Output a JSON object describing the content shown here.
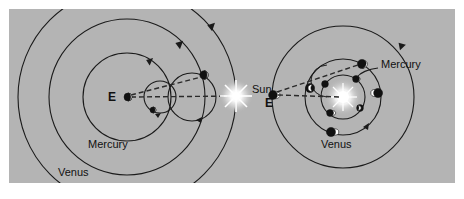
{
  "figure": {
    "background_color": "#b4b4b4",
    "page_color": "#ffffff",
    "ink_color": "#1a1a1a",
    "width": 464,
    "height": 199
  },
  "shared": {
    "sun_label": "Sun",
    "sun_x": 236,
    "sun_y": 96,
    "sun_color": "#ffffff"
  },
  "left_model": {
    "name": "ptolemaic-geocentric-model",
    "center_label": "E",
    "center_x": 127,
    "center_y": 97,
    "deferents": [
      {
        "name": "Mercury",
        "label": "Mercury",
        "radius": 44,
        "label_x": 112,
        "label_y": 148
      },
      {
        "name": "Venus",
        "label": "Venus",
        "radius": 78,
        "label_x": 82,
        "label_y": 175
      }
    ],
    "epicycles": [
      {
        "planet": "Mercury",
        "center_x": 160,
        "center_y": 97,
        "radius": 16,
        "phase_angle": 125
      },
      {
        "planet": "Venus",
        "center_x": 192,
        "center_y": 97,
        "radius": 24,
        "phase_angle": 58
      }
    ],
    "sightlines": [
      {
        "from": "E",
        "to": "Sun"
      },
      {
        "from": "E",
        "to": "Venus-epicycle-planet"
      }
    ]
  },
  "right_model": {
    "name": "copernican-heliocentric-model",
    "sun_x": 343,
    "sun_y": 97,
    "earth_label": "E",
    "earth_x": 273,
    "earth_y": 96,
    "orbits": [
      {
        "name": "Mercury",
        "label": "Mercury",
        "radius": 22,
        "label_x": 382,
        "label_y": 70
      },
      {
        "name": "Venus",
        "label": "Venus",
        "radius": 38,
        "label_x": 341,
        "label_y": 141
      },
      {
        "name": "Earth",
        "label": "",
        "radius": 71,
        "label_x": 0,
        "label_y": 0
      }
    ],
    "mercury_positions_deg": [
      55,
      145,
      235,
      325
    ],
    "venus_positions_deg": [
      60,
      150,
      240,
      330
    ],
    "sightlines": [
      {
        "from": "E",
        "to": "Sun"
      },
      {
        "from": "E",
        "to": "Venus-upper"
      }
    ]
  }
}
